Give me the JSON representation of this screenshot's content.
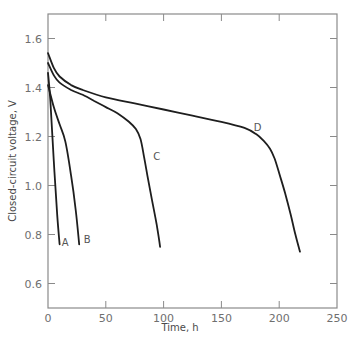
{
  "chart_data": {
    "type": "line",
    "title": "",
    "xlabel": "Time, h",
    "ylabel": "Closed-circuit voltage, V",
    "xlim": [
      0,
      250
    ],
    "ylim": [
      0.5,
      1.7
    ],
    "xticks": [
      0,
      50,
      100,
      150,
      200,
      250
    ],
    "yticks": [
      0.6,
      0.8,
      1.0,
      1.2,
      1.4,
      1.6
    ],
    "xtick_labels": [
      "0",
      "50",
      "100",
      "150",
      "200",
      "250"
    ],
    "ytick_labels": [
      "0.6",
      "0.8",
      "1.0",
      "1.2",
      "1.4",
      "1.6"
    ],
    "grid": false,
    "legend": "inline curve labels",
    "series": [
      {
        "name": "A",
        "label_pos": [
          12,
          0.77
        ],
        "x": [
          0,
          2,
          5,
          8,
          10
        ],
        "y": [
          1.46,
          1.35,
          1.1,
          0.88,
          0.76
        ]
      },
      {
        "name": "B",
        "label_pos": [
          31,
          0.78
        ],
        "x": [
          0,
          5,
          10,
          15,
          20,
          24,
          27
        ],
        "y": [
          1.41,
          1.32,
          1.25,
          1.18,
          1.04,
          0.9,
          0.76
        ]
      },
      {
        "name": "C",
        "label_pos": [
          91,
          1.12
        ],
        "x": [
          0,
          5,
          10,
          20,
          30,
          40,
          50,
          60,
          70,
          76,
          80,
          83,
          86,
          90,
          94,
          97
        ],
        "y": [
          1.5,
          1.45,
          1.42,
          1.39,
          1.37,
          1.345,
          1.32,
          1.295,
          1.26,
          1.23,
          1.19,
          1.12,
          1.04,
          0.94,
          0.84,
          0.75
        ]
      },
      {
        "name": "D",
        "label_pos": [
          178,
          1.24
        ],
        "x": [
          0,
          5,
          10,
          20,
          30,
          50,
          75,
          100,
          125,
          150,
          170,
          180,
          187,
          192,
          196,
          200,
          205,
          210,
          214,
          218
        ],
        "y": [
          1.54,
          1.48,
          1.445,
          1.41,
          1.39,
          1.36,
          1.335,
          1.31,
          1.285,
          1.26,
          1.235,
          1.21,
          1.18,
          1.15,
          1.11,
          1.05,
          0.97,
          0.88,
          0.8,
          0.73
        ]
      }
    ]
  },
  "style": {
    "line_color": "#1e1e1e",
    "axis_color": "#8a8a8a",
    "text_color": "#6f6f6f"
  }
}
